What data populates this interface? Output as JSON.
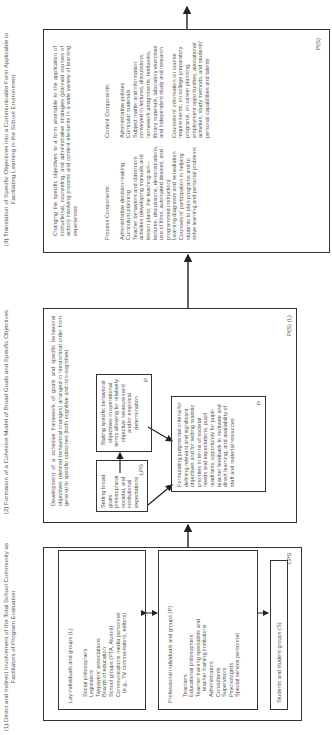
{
  "column1": {
    "header": "(1) Direct and Indirect Involvement of the Total School Community as Facilitators of Program Evaluation",
    "lay": {
      "title": "Lay individuals and groups (L)",
      "items": [
        "Social philosophers",
        "Legislators",
        "Taxpayers' associations",
        "Boards of education",
        "School groups (PTA, Alumni)",
        "Communications media personnel",
        "(e.g., TV commentators, editors)"
      ]
    },
    "professional": {
      "title": "Professional individuals and groups (P)",
      "items": [
        "Teachers",
        "Educational philosophers",
        "Teacher training specialists and",
        "teacher training institutions",
        "Administrators",
        "Consultants",
        "Supervisors",
        "Psychologists",
        "Special service personnel"
      ]
    },
    "students": {
      "title": "Students and student groups (S)"
    },
    "tag": "LPS"
  },
  "column2": {
    "header": "(2) Formation of a Cohesive Model of Broad Goals and Specific Objectives",
    "intro": "Development of a cohesive framework of goals and specific behavioral objectives (desired behavioral changes) arranged in hierarchical order from general to specific outcomes (both cognitive and non-cognitive)",
    "broad_goals": {
      "text": "Setting broad goals: philosophical societal, and institutional expectations",
      "tag": "LPS"
    },
    "specific_objectives": {
      "text": "Stating specific behavioral objectives in operational terms allowing for relatively objective measurement and/or empirical determination",
      "tag": "P"
    },
    "criteria": {
      "text": "Formulating judgmental criteria for defining relevant and significant objectives and for setting realistic priorities in terms of societal needs and expectations, pupil readiness, opportunity for pupil-teacher feedback to motivate and direct learning, and availability of staff and material resources",
      "tag": "P"
    },
    "tag": "P(S) (L)"
  },
  "column3": {
    "header": "(3) Translation of Specific Objectives into a Communicable Form Applicable to Facilitating Learning in the School Environment",
    "intro": "Changing the specific objectives to a form amenable to the application of instructional, counseling, and administrative strategies (planned courses of action) involving process and content elements in a wide variety of learning experiences",
    "process": {
      "title": "Process Components:",
      "items": [
        "Administrative decision-making",
        "Curriculum planning",
        "Teacher behaviors and classroom activities (developing manuals and lesson plans; the teaching act—lectures, discussions, demonstrations, use of films, automated devices, and programmed instruction)",
        "Learning diagnosis and remediation",
        "Counselors' participation in helping students to plan programs and to solve learning and personal problems"
      ]
    },
    "content": {
      "title": "Content Components:",
      "items": [
        "Administrative policies",
        "Curricular materials",
        "Subject matter and information conveyed in lectures, discussions, homework assignments, textbooks, library materials, laboratory exercises and independent study and research",
        "Counselors' information on course requirements, on college preparatory programs, on career planning, employment opportunities, avocational activities, study methods, and students' personal capabilities and talents"
      ]
    },
    "tag": "P(S)"
  }
}
